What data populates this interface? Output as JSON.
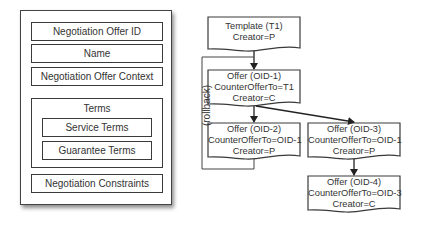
{
  "structure": {
    "fields": [
      {
        "label": "Negotiation Offer ID"
      },
      {
        "label": "Name"
      },
      {
        "label": "Negotiation Offer Context"
      }
    ],
    "terms": {
      "label": "Terms",
      "items": [
        {
          "label": "Service Terms"
        },
        {
          "label": "Guarantee Terms"
        }
      ]
    },
    "constraints": {
      "label": "Negotiation Constraints"
    }
  },
  "flow": {
    "rollback_label": "(rollback)",
    "nodes": [
      {
        "id": "T1",
        "lines": [
          "Template (T1)",
          "Creator=P"
        ]
      },
      {
        "id": "OID-1",
        "lines": [
          "Offer (OID-1)",
          "CounterOfferTo=T1",
          "Creator=C"
        ]
      },
      {
        "id": "OID-2",
        "lines": [
          "Offer (OID-2)",
          "CounterOfferTo=OID-1",
          "Creator=P"
        ]
      },
      {
        "id": "OID-3",
        "lines": [
          "Offer (OID-3)",
          "CounterOfferTo=OID-1",
          "Creator=P"
        ]
      },
      {
        "id": "OID-4",
        "lines": [
          "Offer (OID-4)",
          "CounterOfferTo=OID-3",
          "Creator=C"
        ]
      }
    ],
    "edges": [
      {
        "from": "T1",
        "to": "OID-1"
      },
      {
        "from": "OID-1",
        "to": "OID-2"
      },
      {
        "from": "OID-1",
        "to": "OID-3"
      },
      {
        "from": "OID-3",
        "to": "OID-4"
      },
      {
        "from": "OID-2",
        "to": "OID-1",
        "label": "(rollback)"
      }
    ]
  }
}
